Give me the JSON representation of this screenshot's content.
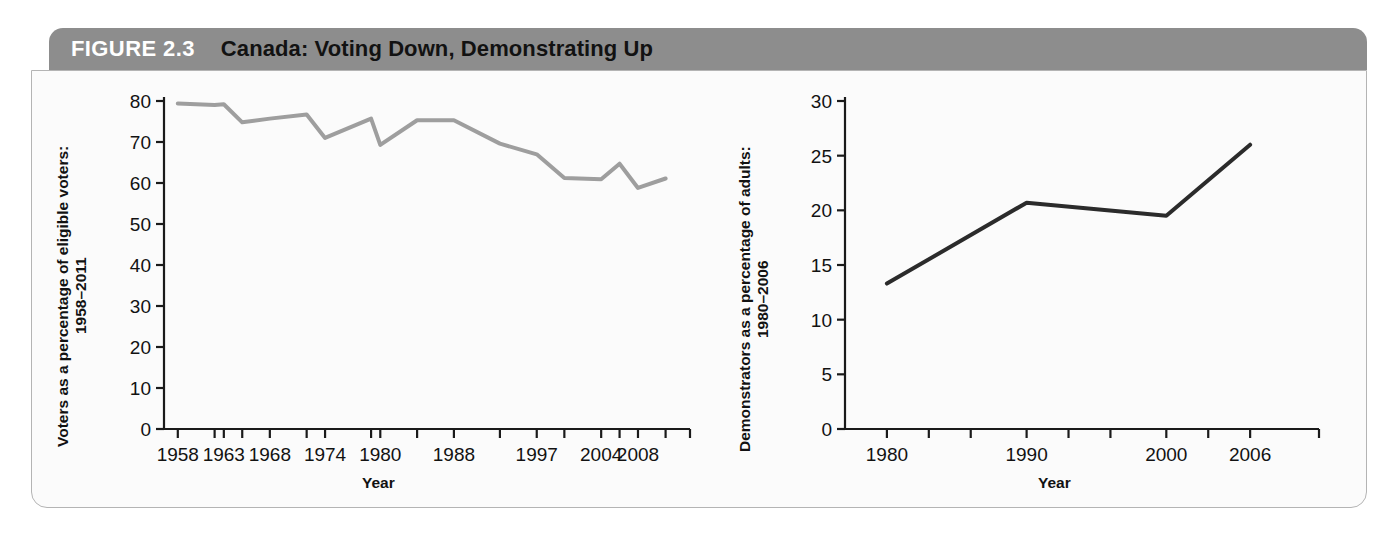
{
  "figure": {
    "number_label": "FIGURE 2.3",
    "title": "Canada: Voting Down, Demonstrating Up",
    "header_bg": "#8d8d8d",
    "panel_bg": "#fbfbfb",
    "border_color": "#b4b4b4"
  },
  "background_text": {
    "left_column": "than their parents or their grandparents were at a similar point in the life cycle, and political ideology, bringing people together. Meanwhile, changing forms of media and communication have expanded the scope of civil society, as well as the ways of being engaged, in ways that cut across other divisions. In short, there are several factors that may be causing such a decline, and they are not likely to reverse themselves anytime soon. Some research suggests a potential interest in the new political world and people, yet to be realized. Students and youth in the forefront of the community and opposition thus and opposition of the social and political.",
    "right_column": "people and movements of protest, bridging people together, and community groups. A modern movement is a critical category: because of your individual about how we can act in certain context may not be a sign. A social movement is a sustained set of organized activities to promote or resist change in a society. A social movement typically includes people outside established institutions and sometimes uses extraordinary tactics such as demonstrations and protest marches that bring public attention and force social change."
  },
  "charts": [
    {
      "id": "voters",
      "chart_data": {
        "type": "line",
        "title": "",
        "ylabel": "Voters as a percentage of eligible voters: 1958–2011",
        "xlabel": "Year",
        "ylim": [
          0,
          80
        ],
        "yticks": [
          0,
          10,
          20,
          30,
          40,
          50,
          60,
          70,
          80
        ],
        "ytick_labels": [
          "0",
          "10",
          "20",
          "30",
          "40",
          "50",
          "60",
          "70",
          "80"
        ],
        "x": [
          1958,
          1962,
          1963,
          1965,
          1968,
          1972,
          1974,
          1979,
          1980,
          1984,
          1988,
          1993,
          1997,
          2000,
          2004,
          2006,
          2008,
          2011
        ],
        "xtick_labels": [
          "1958",
          "1963",
          "1968",
          "1974",
          "1980",
          "1988",
          "1997",
          "2004",
          "2008"
        ],
        "xtick_label_positions": [
          1958,
          1963,
          1968,
          1974,
          1980,
          1988,
          1997,
          2004,
          2008
        ],
        "values": [
          79.4,
          79.0,
          79.2,
          74.8,
          75.7,
          76.7,
          71.0,
          75.7,
          69.3,
          75.3,
          75.3,
          69.6,
          67.0,
          61.2,
          60.9,
          64.7,
          58.8,
          61.1
        ],
        "line_color": "#9e9e9e",
        "line_width": 4,
        "grid": false,
        "legend": "none"
      }
    },
    {
      "id": "demonstrators",
      "chart_data": {
        "type": "line",
        "title": "",
        "ylabel": "Demonstrators as a percentage of adults: 1980–2006",
        "xlabel": "Year",
        "ylim": [
          0,
          30
        ],
        "yticks": [
          0,
          5,
          10,
          15,
          20,
          25,
          30
        ],
        "ytick_labels": [
          "0",
          "5",
          "10",
          "15",
          "20",
          "25",
          "30"
        ],
        "x": [
          1980,
          1990,
          2000,
          2006
        ],
        "xtick_labels": [
          "1980",
          "1990",
          "2000",
          "2006"
        ],
        "values": [
          13.3,
          20.7,
          19.5,
          26.0
        ],
        "line_color": "#2b2b2b",
        "line_width": 4,
        "grid": false,
        "legend": "none"
      }
    }
  ]
}
